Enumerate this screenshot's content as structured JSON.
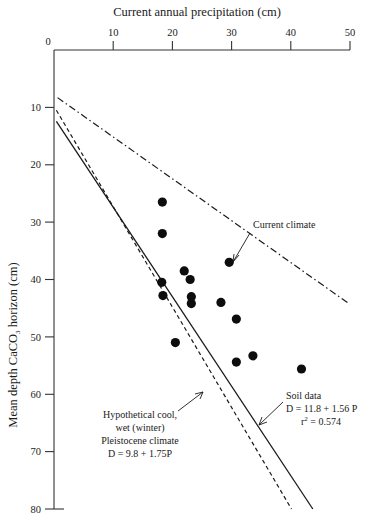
{
  "figure": {
    "title_top": "Current annual precipitation (cm)",
    "ylabel": "Mean depth CaCO3 horizon (cm)",
    "ylabel_main": "Mean depth CaCO",
    "ylabel_sub": "3",
    "ylabel_tail": " horizon (cm)"
  },
  "annotations": {
    "current_climate": "Current climate",
    "soil_data_line1": "Soil data",
    "soil_data_line2": "D = 11.8 + 1.56 P",
    "soil_data_line3_main": "r",
    "soil_data_line3_sup": "2",
    "soil_data_line3_tail": " = 0.574",
    "hypothetical_line1": "Hypothetical cool,",
    "hypothetical_line2": "wet (winter)",
    "hypothetical_line3": "Pleistocene climate",
    "hypothetical_line4": "D = 9.8 + 1.75P"
  },
  "chart_data": {
    "type": "scatter",
    "title": "Current annual precipitation (cm)",
    "xlabel": "Current annual precipitation (cm)",
    "ylabel": "Mean depth CaCO3 horizon (cm)",
    "xlim": [
      0,
      50
    ],
    "ylim": [
      0,
      80
    ],
    "y_inverted": true,
    "x_axis_position": "top",
    "grid": false,
    "legend": "none",
    "xticks": [
      0,
      10,
      20,
      30,
      40,
      50
    ],
    "xtick_labels": [
      "0",
      "10",
      "20",
      "30",
      "40",
      "50"
    ],
    "yticks": [
      0,
      10,
      20,
      30,
      40,
      50,
      60,
      70,
      80
    ],
    "ytick_labels": [
      "0",
      "10",
      "20",
      "30",
      "40",
      "50",
      "60",
      "70",
      "80"
    ],
    "series": [
      {
        "name": "Soil data",
        "type": "scatter",
        "marker": "filled-circle",
        "color": "#0d0d0d",
        "points": [
          {
            "x": 18.3,
            "y": 26.5
          },
          {
            "x": 18.3,
            "y": 32.0
          },
          {
            "x": 22.0,
            "y": 38.5
          },
          {
            "x": 18.2,
            "y": 40.5
          },
          {
            "x": 18.4,
            "y": 42.8
          },
          {
            "x": 23.0,
            "y": 40.0
          },
          {
            "x": 23.2,
            "y": 43.0
          },
          {
            "x": 23.2,
            "y": 44.2
          },
          {
            "x": 29.6,
            "y": 37.0
          },
          {
            "x": 28.2,
            "y": 44.0
          },
          {
            "x": 20.5,
            "y": 51.0
          },
          {
            "x": 30.8,
            "y": 46.9
          },
          {
            "x": 33.6,
            "y": 53.3
          },
          {
            "x": 30.8,
            "y": 54.4
          },
          {
            "x": 41.8,
            "y": 55.6
          }
        ]
      },
      {
        "name": "Soil data regression",
        "type": "line",
        "style": "solid",
        "color": "#1a1a1a",
        "equation": "D = 11.8 + 1.56 P",
        "intercept": 11.8,
        "slope": 1.56,
        "r_squared": 0.574,
        "x_range": [
          0.4,
          45.5
        ]
      },
      {
        "name": "Hypothetical cool, wet (winter) Pleistocene climate",
        "type": "line",
        "style": "dashed",
        "color": "#1a1a1a",
        "equation": "D = 9.8 + 1.75P",
        "intercept": 9.8,
        "slope": 1.75,
        "x_range": [
          0.4,
          40.2
        ]
      },
      {
        "name": "Current climate",
        "type": "line",
        "style": "dash-dot",
        "color": "#1a1a1a",
        "x_range": [
          0.6,
          51.6
        ],
        "y_range": [
          8.3,
          45.5
        ]
      }
    ],
    "annotations": [
      {
        "text": "Current climate",
        "x": 30.5,
        "y": 29.0,
        "points_to": {
          "x": 29.6,
          "y": 37.0
        }
      },
      {
        "text": "Soil data / D = 11.8 + 1.56 P / r2 = 0.574",
        "x": 34.0,
        "y": 58.0,
        "points_to": {
          "x": 29.0,
          "y": 62.0
        }
      },
      {
        "text": "Hypothetical cool, wet (winter) Pleistocene climate / D = 9.8 + 1.75P",
        "x": 13.0,
        "y": 62.0,
        "points_to": {
          "x": 22.0,
          "y": 57.5
        }
      }
    ]
  }
}
